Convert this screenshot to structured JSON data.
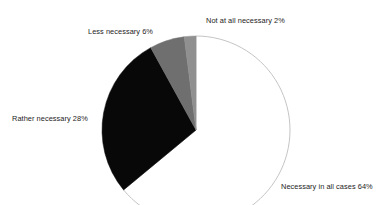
{
  "chart_data": {
    "type": "pie",
    "title": "",
    "subtitle": "",
    "xlabel": "",
    "ylabel": "",
    "legend_position": "none",
    "grid": false,
    "units": "percent",
    "total": 100,
    "start_angle_deg": 0,
    "direction": "clockwise",
    "categories": [
      "Necessary in all cases",
      "Rather necessary",
      "Less necessary",
      "Not at all necessary"
    ],
    "values": [
      64,
      28,
      6,
      2
    ],
    "slices": [
      {
        "label": "Necessary in all cases",
        "value": 64,
        "value_text": "64%",
        "label_text": "Necessary in all cases 64%",
        "color": "#ffffff",
        "stroke": "#b5b5b5"
      },
      {
        "label": "Rather necessary",
        "value": 28,
        "value_text": "28%",
        "label_text": "Rather necessary 28%",
        "color": "#080808",
        "stroke": "#080808"
      },
      {
        "label": "Less necessary",
        "value": 6,
        "value_text": "6%",
        "label_text": "Less necessary 6%",
        "color": "#6f6f6f",
        "stroke": "#6f6f6f"
      },
      {
        "label": "Not at all necessary",
        "value": 2,
        "value_text": "2%",
        "label_text": "Not at all necessary 2%",
        "color": "#909090",
        "stroke": "#909090"
      }
    ]
  },
  "labels": {
    "not_at_all": "Not at all necessary 2%",
    "less": "Less necessary 6%",
    "rather": "Rather necessary 28%",
    "necessary_all": "Necessary in all cases 64%"
  },
  "colors": {
    "background": "#ffffff",
    "text": "#1d1d1d",
    "slice_black": "#080808",
    "slice_gray_mid": "#6f6f6f",
    "slice_gray_light": "#909090",
    "slice_white": "#ffffff",
    "outline": "#b5b5b5"
  }
}
